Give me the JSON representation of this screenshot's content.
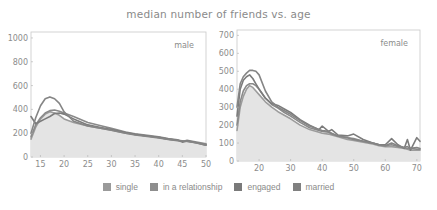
{
  "title": "median number of friends vs. age",
  "legend": [
    {
      "label": "single",
      "color": "#9a9a9a"
    },
    {
      "label": "in a relationship",
      "color": "#8e8e8e"
    },
    {
      "label": "engaged",
      "color": "#7a7a7a"
    },
    {
      "label": "married",
      "color": "#808080"
    }
  ],
  "chart_data": [
    {
      "type": "area",
      "panel": "male",
      "title": "median number of friends vs. age",
      "xlabel": "",
      "ylabel": "",
      "xlim": [
        13,
        50
      ],
      "ylim": [
        0,
        1050
      ],
      "xticks": [
        15,
        20,
        25,
        30,
        35,
        40,
        45,
        50
      ],
      "yticks": [
        0,
        200,
        400,
        600,
        800,
        1000
      ],
      "grid": false,
      "legend_position": "bottom",
      "x": [
        13,
        14,
        15,
        16,
        17,
        18,
        19,
        20,
        22,
        25,
        28,
        30,
        33,
        35,
        38,
        40,
        42,
        44,
        45,
        46,
        48,
        50
      ],
      "series": [
        {
          "name": "single",
          "values": [
            150,
            250,
            320,
            360,
            380,
            370,
            350,
            320,
            290,
            260,
            240,
            225,
            200,
            190,
            175,
            165,
            150,
            140,
            135,
            130,
            120,
            105
          ],
          "fill": true
        },
        {
          "name": "in a relationship",
          "values": [
            170,
            270,
            330,
            370,
            390,
            395,
            385,
            370,
            340,
            290,
            260,
            240,
            210,
            195,
            180,
            170,
            155,
            145,
            130,
            140,
            125,
            110
          ]
        },
        {
          "name": "engaged",
          "values": [
            340,
            280,
            300,
            320,
            340,
            365,
            370,
            360,
            320,
            270,
            245,
            230,
            205,
            190,
            175,
            165,
            150,
            140,
            125,
            135,
            120,
            100
          ]
        },
        {
          "name": "married",
          "values": [
            200,
            330,
            430,
            490,
            505,
            490,
            450,
            380,
            300,
            260,
            240,
            225,
            200,
            185,
            170,
            160,
            148,
            138,
            135,
            132,
            118,
            100
          ]
        }
      ],
      "annotations": [
        "male"
      ]
    },
    {
      "type": "area",
      "panel": "female",
      "title": "median number of friends vs. age",
      "xlabel": "",
      "ylabel": "",
      "xlim": [
        13,
        71
      ],
      "ylim": [
        0,
        730
      ],
      "xticks": [
        20,
        30,
        40,
        50,
        60,
        70
      ],
      "yticks": [
        0,
        100,
        200,
        300,
        400,
        500,
        600,
        700
      ],
      "grid": false,
      "legend_position": "bottom",
      "x": [
        13,
        14,
        15,
        16,
        17,
        18,
        19,
        20,
        22,
        24,
        26,
        28,
        30,
        33,
        36,
        39,
        40,
        42,
        43,
        45,
        48,
        50,
        53,
        56,
        58,
        60,
        62,
        64,
        66,
        67,
        68,
        70,
        71
      ],
      "series": [
        {
          "name": "single",
          "values": [
            170,
            300,
            360,
            400,
            420,
            410,
            390,
            370,
            330,
            300,
            275,
            255,
            235,
            200,
            175,
            160,
            155,
            150,
            145,
            135,
            120,
            115,
            105,
            95,
            85,
            80,
            80,
            75,
            70,
            65,
            60,
            60,
            60
          ],
          "fill": true
        },
        {
          "name": "in a relationship",
          "values": [
            200,
            330,
            390,
            420,
            430,
            430,
            420,
            400,
            350,
            315,
            295,
            270,
            250,
            215,
            185,
            170,
            165,
            160,
            150,
            140,
            130,
            125,
            110,
            100,
            90,
            85,
            90,
            80,
            75,
            70,
            70,
            65,
            65
          ]
        },
        {
          "name": "engaged",
          "values": [
            250,
            400,
            450,
            470,
            480,
            460,
            430,
            400,
            350,
            320,
            310,
            290,
            270,
            230,
            200,
            175,
            195,
            165,
            175,
            145,
            140,
            150,
            120,
            100,
            90,
            90,
            125,
            90,
            70,
            120,
            60,
            130,
            110
          ]
        },
        {
          "name": "married",
          "values": [
            300,
            430,
            470,
            490,
            505,
            505,
            500,
            480,
            390,
            330,
            300,
            280,
            260,
            225,
            195,
            175,
            170,
            165,
            155,
            140,
            130,
            120,
            110,
            100,
            90,
            85,
            100,
            85,
            75,
            80,
            70,
            75,
            70
          ]
        }
      ],
      "annotations": [
        "female"
      ]
    }
  ]
}
